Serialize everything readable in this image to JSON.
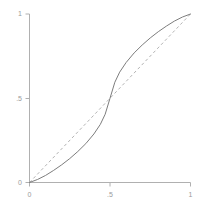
{
  "chart_data": {
    "type": "line",
    "title": "",
    "subtitle": "",
    "xlabel": "",
    "ylabel": "",
    "xlim": [
      0,
      1
    ],
    "ylim": [
      0,
      1
    ],
    "grid": false,
    "legend": "none",
    "x_ticks": [
      {
        "value": 0,
        "label": "0"
      },
      {
        "value": 0.5,
        "label": ".5"
      },
      {
        "value": 1,
        "label": "1"
      }
    ],
    "y_ticks": [
      {
        "value": 0,
        "label": "0"
      },
      {
        "value": 0.5,
        "label": ".5"
      },
      {
        "value": 1,
        "label": "1"
      }
    ],
    "series": [
      {
        "name": "s-curve",
        "style": "solid",
        "color": "#7d7d7d",
        "width": 1.0,
        "x": [
          0.0,
          0.05,
          0.1,
          0.15,
          0.2,
          0.25,
          0.3,
          0.35,
          0.4,
          0.44,
          0.47,
          0.5,
          0.53,
          0.56,
          0.6,
          0.65,
          0.7,
          0.75,
          0.8,
          0.85,
          0.9,
          0.95,
          1.0
        ],
        "values": [
          0.0,
          0.018,
          0.042,
          0.072,
          0.105,
          0.142,
          0.184,
          0.231,
          0.288,
          0.345,
          0.405,
          0.5,
          0.595,
          0.655,
          0.712,
          0.769,
          0.816,
          0.858,
          0.895,
          0.928,
          0.958,
          0.982,
          1.0
        ]
      },
      {
        "name": "diagonal-reference",
        "style": "dashed",
        "color": "#b4b4b4",
        "width": 1.0,
        "x": [
          0,
          1
        ],
        "values": [
          0,
          1
        ]
      }
    ],
    "axis_color": "#b0b0b0",
    "tick_color": "#b0b0b0",
    "background": "#ffffff"
  },
  "axes": {
    "y_tick_0": "0",
    "y_tick_half": ".5",
    "y_tick_1": "1",
    "x_tick_0": "0",
    "x_tick_half": ".5",
    "x_tick_1": "1"
  }
}
